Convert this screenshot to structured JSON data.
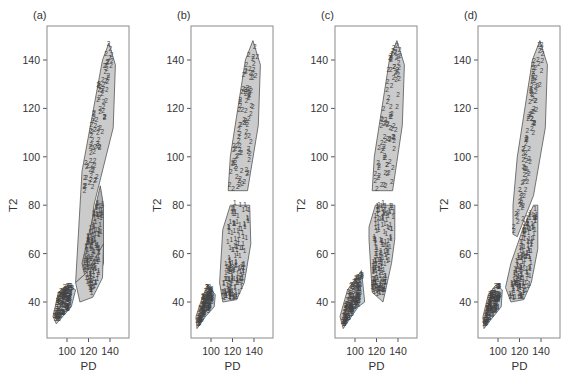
{
  "figure": {
    "width": 570,
    "height": 376,
    "panel_labels": [
      "(a)",
      "(b)",
      "(c)",
      "(d)"
    ],
    "xlabel": "PD",
    "ylabel": "T2",
    "x_ticks": [
      100,
      120,
      140
    ],
    "y_ticks": [
      40,
      60,
      80,
      100,
      120,
      140
    ],
    "colors": {
      "frame": "#8a8a8a",
      "hull_fill": "#c8c8c8",
      "hull_fill_dark": "#a4a4a4",
      "hull_stroke": "#555555",
      "marker": "#444444"
    }
  },
  "chart_data": [
    {
      "type": "scatter",
      "title": "(a)",
      "xlabel": "PD",
      "ylabel": "T2",
      "xlim": [
        82,
        158
      ],
      "ylim": [
        25,
        154
      ],
      "grid": false,
      "hulls": [
        {
          "cluster": "2",
          "shade": "light",
          "points": [
            [
              139,
              147
            ],
            [
              145,
              138
            ],
            [
              143,
              112
            ],
            [
              125,
              80
            ],
            [
              118,
              52
            ],
            [
              108,
              48
            ],
            [
              114,
              94
            ],
            [
              133,
              140
            ]
          ]
        },
        {
          "cluster": "1",
          "shade": "dark",
          "points": [
            [
              131,
              88
            ],
            [
              134,
              80
            ],
            [
              134,
              56
            ],
            [
              123,
              42
            ],
            [
              117,
              50
            ],
            [
              114,
              56
            ]
          ]
        },
        {
          "cluster": "1",
          "shade": "light",
          "points": [
            [
              134,
              64
            ],
            [
              133,
              50
            ],
            [
              124,
              42
            ],
            [
              112,
              40
            ],
            [
              108,
              48
            ],
            [
              118,
              52
            ]
          ]
        },
        {
          "cluster": "3",
          "shade": "light",
          "points": [
            [
              101,
              47
            ],
            [
              108,
              45
            ],
            [
              104,
              38
            ],
            [
              90,
              31
            ],
            [
              87,
              34
            ],
            [
              92,
              44
            ]
          ]
        }
      ],
      "clusters": [
        {
          "label": "2",
          "n": 90,
          "region": {
            "x_at_top": [
              134,
              144
            ],
            "x_at_bottom": [
              113,
              126
            ],
            "y_range": [
              84,
              146
            ]
          }
        },
        {
          "label": "1",
          "n": 150,
          "region": {
            "x_at_top": [
              120,
              134
            ],
            "x_at_bottom": [
              112,
              128
            ],
            "y_range": [
              42,
              82
            ]
          }
        },
        {
          "label": "3",
          "n": 130,
          "region": {
            "x_at_top": [
              94,
              106
            ],
            "x_at_bottom": [
              87,
              100
            ],
            "y_range": [
              32,
              46
            ]
          }
        }
      ]
    },
    {
      "type": "scatter",
      "title": "(b)",
      "xlabel": "PD",
      "ylabel": "T2",
      "xlim": [
        82,
        158
      ],
      "ylim": [
        25,
        154
      ],
      "grid": false,
      "hulls": [
        {
          "cluster": "2",
          "shade": "light",
          "points": [
            [
              139,
              148
            ],
            [
              146,
              138
            ],
            [
              144,
              113
            ],
            [
              134,
              86
            ],
            [
              116,
              86
            ],
            [
              118,
              100
            ],
            [
              132,
              140
            ]
          ]
        },
        {
          "cluster": "1",
          "shade": "light",
          "points": [
            [
              118,
              80
            ],
            [
              136,
              80
            ],
            [
              137,
              64
            ],
            [
              131,
              48
            ],
            [
              124,
              41
            ],
            [
              111,
              40
            ],
            [
              108,
              48
            ],
            [
              111,
              70
            ]
          ]
        },
        {
          "cluster": "3",
          "shade": "light",
          "points": [
            [
              97,
              47
            ],
            [
              104,
              43
            ],
            [
              103,
              38
            ],
            [
              95,
              34
            ],
            [
              87,
              29
            ],
            [
              86,
              34
            ],
            [
              92,
              42
            ]
          ]
        }
      ],
      "clusters": [
        {
          "label": "2",
          "n": 90,
          "region": {
            "x_at_top": [
              134,
              144
            ],
            "x_at_bottom": [
              116,
              134
            ],
            "y_range": [
              86,
              146
            ]
          }
        },
        {
          "label": "1",
          "n": 170,
          "region": {
            "x_at_top": [
              118,
              136
            ],
            "x_at_bottom": [
              110,
              128
            ],
            "y_range": [
              41,
              80
            ]
          }
        },
        {
          "label": "3",
          "n": 120,
          "region": {
            "x_at_top": [
              94,
              103
            ],
            "x_at_bottom": [
              86,
              98
            ],
            "y_range": [
              30,
              46
            ]
          }
        }
      ]
    },
    {
      "type": "scatter",
      "title": "(c)",
      "xlabel": "PD",
      "ylabel": "T2",
      "xlim": [
        82,
        158
      ],
      "ylim": [
        25,
        154
      ],
      "grid": false,
      "hulls": [
        {
          "cluster": "2",
          "shade": "light",
          "points": [
            [
              139,
              148
            ],
            [
              146,
              138
            ],
            [
              144,
              113
            ],
            [
              135,
              86
            ],
            [
              116,
              86
            ],
            [
              118,
              100
            ],
            [
              132,
              140
            ]
          ]
        },
        {
          "cluster": "1",
          "shade": "light",
          "points": [
            [
              119,
              80
            ],
            [
              137,
              80
            ],
            [
              137,
              66
            ],
            [
              134,
              56
            ],
            [
              126,
              40
            ],
            [
              116,
              44
            ],
            [
              113,
              66
            ],
            [
              113,
              71
            ]
          ]
        },
        {
          "cluster": "3",
          "shade": "light",
          "points": [
            [
              106,
              53
            ],
            [
              109,
              40
            ],
            [
              103,
              38
            ],
            [
              89,
              29
            ],
            [
              86,
              34
            ],
            [
              93,
              45
            ]
          ]
        }
      ],
      "clusters": [
        {
          "label": "2",
          "n": 90,
          "region": {
            "x_at_top": [
              134,
              144
            ],
            "x_at_bottom": [
              116,
              134
            ],
            "y_range": [
              86,
              146
            ]
          }
        },
        {
          "label": "1",
          "n": 180,
          "region": {
            "x_at_top": [
              119,
              137
            ],
            "x_at_bottom": [
              115,
              128
            ],
            "y_range": [
              42,
              80
            ]
          }
        },
        {
          "label": "3",
          "n": 140,
          "region": {
            "x_at_top": [
              98,
              108
            ],
            "x_at_bottom": [
              87,
              100
            ],
            "y_range": [
              30,
              52
            ]
          }
        }
      ]
    },
    {
      "type": "scatter",
      "title": "(d)",
      "xlabel": "PD",
      "ylabel": "T2",
      "xlim": [
        82,
        158
      ],
      "ylim": [
        25,
        154
      ],
      "grid": false,
      "hulls": [
        {
          "cluster": "2",
          "shade": "light",
          "points": [
            [
              139,
              148
            ],
            [
              146,
              138
            ],
            [
              144,
              112
            ],
            [
              133,
              84
            ],
            [
              118,
              67
            ],
            [
              114,
              68
            ],
            [
              114,
              80
            ],
            [
              118,
              100
            ],
            [
              132,
              140
            ]
          ]
        },
        {
          "cluster": "1",
          "shade": "light",
          "points": [
            [
              133,
              80
            ],
            [
              137,
              80
            ],
            [
              137,
              62
            ],
            [
              131,
              48
            ],
            [
              124,
              41
            ],
            [
              112,
              40
            ],
            [
              107,
              46
            ],
            [
              112,
              56
            ],
            [
              123,
              70
            ]
          ]
        },
        {
          "cluster": "3",
          "shade": "light",
          "points": [
            [
              98,
              47
            ],
            [
              104,
              45
            ],
            [
              103,
              38
            ],
            [
              94,
              33
            ],
            [
              87,
              29
            ],
            [
              86,
              34
            ],
            [
              91,
              43
            ]
          ]
        }
      ],
      "clusters": [
        {
          "label": "2",
          "n": 95,
          "region": {
            "x_at_top": [
              134,
              144
            ],
            "x_at_bottom": [
              114,
              122
            ],
            "y_range": [
              68,
              146
            ]
          }
        },
        {
          "label": "1",
          "n": 170,
          "region": {
            "x_at_top": [
              128,
              137
            ],
            "x_at_bottom": [
              110,
              128
            ],
            "y_range": [
              41,
              80
            ]
          }
        },
        {
          "label": "3",
          "n": 120,
          "region": {
            "x_at_top": [
              94,
              103
            ],
            "x_at_bottom": [
              86,
              98
            ],
            "y_range": [
              30,
              46
            ]
          }
        }
      ]
    }
  ]
}
